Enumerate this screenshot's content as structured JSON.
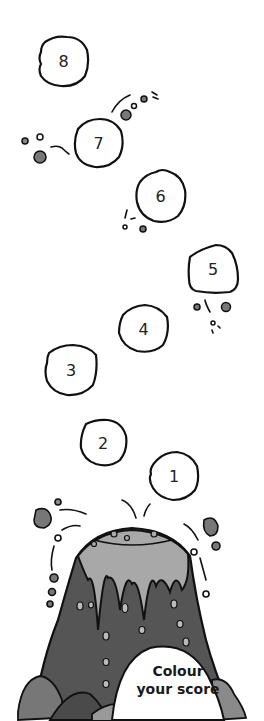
{
  "scoreboard": {
    "boulders": [
      {
        "label": "8"
      },
      {
        "label": "7"
      },
      {
        "label": "6"
      },
      {
        "label": "5"
      },
      {
        "label": "4"
      },
      {
        "label": "3"
      },
      {
        "label": "2"
      },
      {
        "label": "1"
      }
    ],
    "caption_line1": "Colour",
    "caption_line2": "your score"
  },
  "colors": {
    "outline": "#111111",
    "volcano_dark": "#555555",
    "lava_light": "#a8a8a8",
    "rock_mid": "#7a7a7a"
  }
}
